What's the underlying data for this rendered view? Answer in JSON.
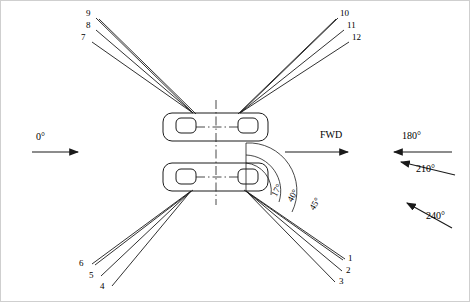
{
  "diagram": {
    "title_visible": false,
    "type": "vehicle-sensor-beam-layout",
    "direction_labels": [
      {
        "name": "zero-deg",
        "text": "0°",
        "x": 38,
        "y": 133
      },
      {
        "name": "fwd",
        "text": "FWD",
        "x": 322,
        "y": 132
      },
      {
        "name": "one-eighty-deg",
        "text": "180°",
        "x": 404,
        "y": 133
      },
      {
        "name": "two-ten-deg",
        "text": "210°",
        "x": 418,
        "y": 168
      },
      {
        "name": "two-forty-deg",
        "text": "240°",
        "x": 428,
        "y": 215
      }
    ],
    "beam_numbers_top_left": [
      {
        "id": "9",
        "x": 88,
        "y": 13
      },
      {
        "id": "8",
        "x": 88,
        "y": 26
      },
      {
        "id": "7",
        "x": 83,
        "y": 38
      }
    ],
    "beam_numbers_top_right": [
      {
        "id": "10",
        "x": 341,
        "y": 13
      },
      {
        "id": "11",
        "x": 348,
        "y": 26
      },
      {
        "id": "12",
        "x": 353,
        "y": 38
      }
    ],
    "beam_numbers_bottom_left": [
      {
        "id": "6",
        "x": 80,
        "y": 264
      },
      {
        "id": "5",
        "x": 90,
        "y": 275
      },
      {
        "id": "4",
        "x": 101,
        "y": 286
      }
    ],
    "beam_numbers_bottom_right": [
      {
        "id": "1",
        "x": 349,
        "y": 259
      },
      {
        "id": "2",
        "x": 347,
        "y": 270
      },
      {
        "id": "3",
        "x": 340,
        "y": 281
      }
    ],
    "angle_labels": [
      {
        "name": "angle-17",
        "text": "17°",
        "x": 274,
        "y": 199,
        "rotate": -62
      },
      {
        "name": "angle-40",
        "text": "40°",
        "x": 289,
        "y": 203,
        "rotate": -60
      },
      {
        "name": "angle-45",
        "text": "45°",
        "x": 311,
        "y": 211,
        "rotate": -58
      }
    ],
    "colors": {
      "line": "#1a1a1a",
      "background": "#ffffff",
      "border": "#cfcfcf"
    }
  }
}
